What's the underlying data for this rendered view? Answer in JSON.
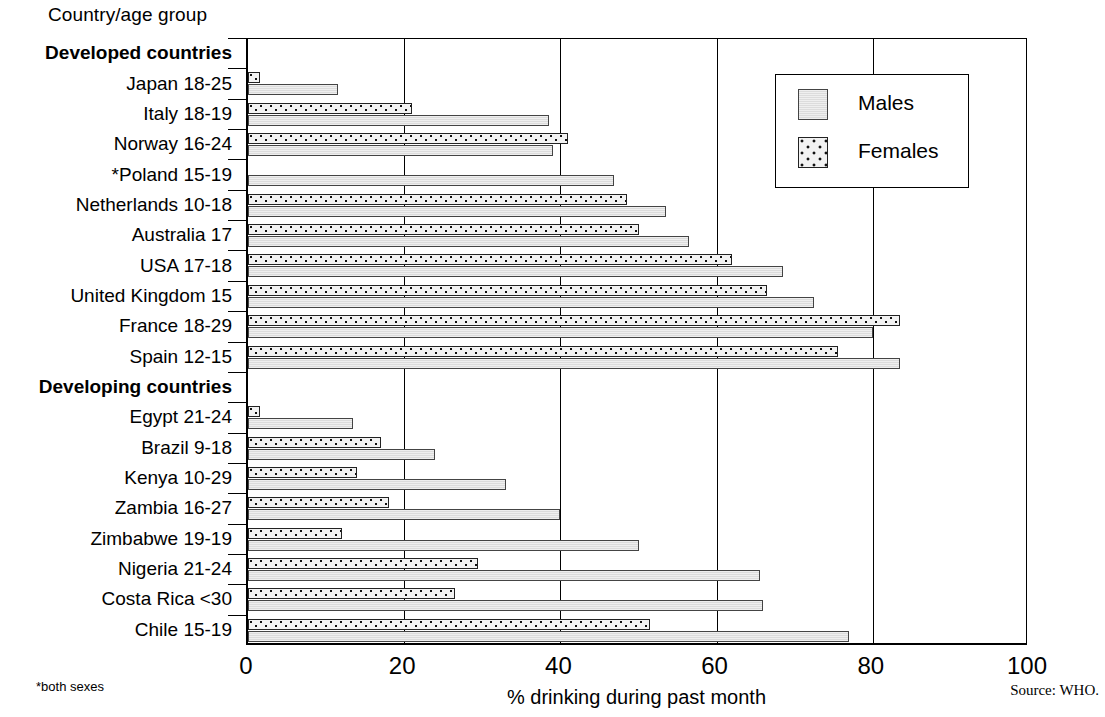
{
  "header": {
    "column_title": "Country/age group"
  },
  "legend": {
    "position": "top-right",
    "entries": [
      {
        "label": "Males",
        "icon": "swatch-light-gray"
      },
      {
        "label": "Females",
        "icon": "swatch-dotted"
      }
    ]
  },
  "axis": {
    "x_title": "% drinking during past month",
    "x_ticks": [
      "0",
      "20",
      "40",
      "60",
      "80",
      "100"
    ],
    "x_min": 0,
    "x_max": 100
  },
  "footnotes": {
    "left": "*both sexes",
    "source": "Source: WHO."
  },
  "chart_data": {
    "type": "bar",
    "orientation": "horizontal",
    "title": "",
    "xlabel": "% drinking during past month",
    "ylabel": "Country/age group",
    "xlim": [
      0,
      100
    ],
    "grid": true,
    "legend_position": "top-right",
    "group_headers": [
      "Developed countries",
      "Developing countries"
    ],
    "categories": [
      "Developed countries",
      "Japan 18-25",
      "Italy 18-19",
      "Norway 16-24",
      "*Poland 15-19",
      "Netherlands 10-18",
      "Australia    17",
      "USA 17-18",
      "United Kingdom    15",
      "France 18-29",
      "Spain 12-15",
      "Developing countries",
      "Egypt 21-24",
      "Brazil   9-18",
      "Kenya 10-29",
      "Zambia 16-27",
      "Zimbabwe 19-19",
      "Nigeria 21-24",
      "Costa Rica    <30",
      "Chile 15-19"
    ],
    "rows": [
      {
        "label": "Developed countries",
        "is_group": true,
        "males": null,
        "females": null
      },
      {
        "label": "Japan 18-25",
        "is_group": false,
        "males": 11.5,
        "females": 1.5
      },
      {
        "label": "Italy 18-19",
        "is_group": false,
        "males": 38.5,
        "females": 21.0
      },
      {
        "label": "Norway 16-24",
        "is_group": false,
        "males": 39.0,
        "females": 41.0
      },
      {
        "label": "*Poland 15-19",
        "is_group": false,
        "males": 46.8,
        "females": null
      },
      {
        "label": "Netherlands 10-18",
        "is_group": false,
        "males": 53.5,
        "females": 48.5
      },
      {
        "label": "Australia    17",
        "is_group": false,
        "males": 56.5,
        "females": 50.0
      },
      {
        "label": "USA 17-18",
        "is_group": false,
        "males": 68.5,
        "females": 62.0
      },
      {
        "label": "United Kingdom    15",
        "is_group": false,
        "males": 72.5,
        "females": 66.5
      },
      {
        "label": "France 18-29",
        "is_group": false,
        "males": 80.0,
        "females": 83.5
      },
      {
        "label": "Spain 12-15",
        "is_group": false,
        "males": 83.5,
        "females": 75.5
      },
      {
        "label": "Developing countries",
        "is_group": true,
        "males": null,
        "females": null
      },
      {
        "label": "Egypt 21-24",
        "is_group": false,
        "males": 13.5,
        "females": 1.5
      },
      {
        "label": "Brazil   9-18",
        "is_group": false,
        "males": 24.0,
        "females": 17.0
      },
      {
        "label": "Kenya 10-29",
        "is_group": false,
        "males": 33.0,
        "females": 14.0
      },
      {
        "label": "Zambia 16-27",
        "is_group": false,
        "males": 40.0,
        "females": 18.0
      },
      {
        "label": "Zimbabwe 19-19",
        "is_group": false,
        "males": 50.0,
        "females": 12.0
      },
      {
        "label": "Nigeria 21-24",
        "is_group": false,
        "males": 65.5,
        "females": 29.5
      },
      {
        "label": "Costa Rica    <30",
        "is_group": false,
        "males": 66.0,
        "females": 26.5
      },
      {
        "label": "Chile 15-19",
        "is_group": false,
        "males": 77.0,
        "females": 51.5
      }
    ],
    "series": [
      {
        "name": "Males",
        "values": [
          null,
          11.5,
          38.5,
          39.0,
          46.8,
          53.5,
          56.5,
          68.5,
          72.5,
          80.0,
          83.5,
          null,
          13.5,
          24.0,
          33.0,
          40.0,
          50.0,
          65.5,
          66.0,
          77.0
        ]
      },
      {
        "name": "Females",
        "values": [
          null,
          1.5,
          21.0,
          41.0,
          null,
          48.5,
          50.0,
          62.0,
          66.5,
          83.5,
          75.5,
          null,
          1.5,
          17.0,
          14.0,
          18.0,
          12.0,
          29.5,
          26.5,
          51.5
        ]
      }
    ]
  }
}
